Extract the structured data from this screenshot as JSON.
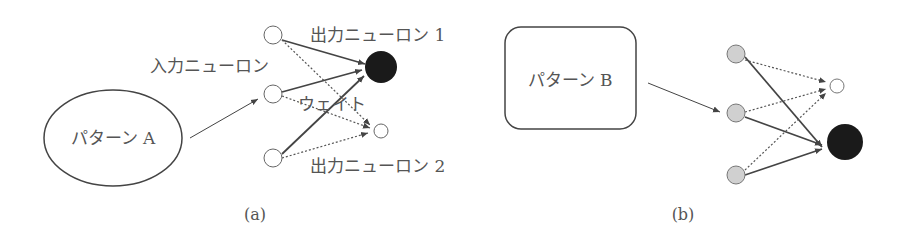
{
  "panel_a": {
    "caption": "(a)",
    "pattern_label": "パターン A",
    "input_label": "入力ニューロン",
    "output1_label": "出力ニューロン 1",
    "output2_label": "出力ニューロン 2",
    "weight_label": "ウェイト"
  },
  "panel_b": {
    "caption": "(b)",
    "pattern_label": "パターン B"
  },
  "colors": {
    "line": "#444444",
    "active_output": "#1a1a1a",
    "input_fill_b": "#d0d0d0"
  }
}
